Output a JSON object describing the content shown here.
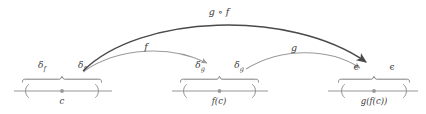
{
  "figure": {
    "colors": {
      "axis": "#8a8a8a",
      "brace": "#6e6e6e",
      "text": "#3b3b3b",
      "arrow_light": "#9a9a9a",
      "arrow_dark": "#4a4a4a",
      "center_dot": "#9a9a9a",
      "background": "#ffffff"
    },
    "axes": [
      {
        "name": "domain-axis",
        "center_label": "c",
        "left_delta_label": "δ",
        "left_delta_sub": "f",
        "right_delta_label": "δ",
        "right_delta_sub": "f"
      },
      {
        "name": "intermediate-axis",
        "center_label": "f(c)",
        "left_delta_label": "δ",
        "left_delta_sub": "g",
        "right_delta_label": "δ",
        "right_delta_sub": "g"
      },
      {
        "name": "codomain-axis",
        "center_label": "g(f(c))",
        "left_delta_label": "ϵ",
        "left_delta_sub": "",
        "right_delta_label": "ϵ",
        "right_delta_sub": ""
      }
    ],
    "arrows": [
      {
        "name": "arrow-f",
        "label": "f"
      },
      {
        "name": "arrow-g",
        "label": "g"
      },
      {
        "name": "arrow-g-compose-f",
        "label": "g ∘ f"
      }
    ]
  }
}
